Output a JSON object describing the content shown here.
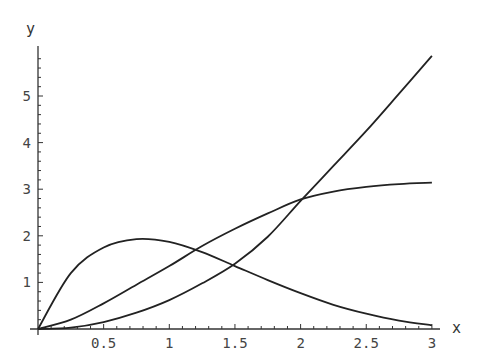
{
  "chart_data": {
    "type": "line",
    "title": "",
    "xlabel": "x",
    "ylabel": "y",
    "xlim": [
      0,
      3
    ],
    "ylim": [
      0,
      5.9
    ],
    "grid": false,
    "legend": null,
    "x_ticks": [
      0.5,
      1,
      1.5,
      2,
      2.5,
      3
    ],
    "x_tick_labels": [
      "0.5",
      "1",
      "1.5",
      "2",
      "2.5",
      "3"
    ],
    "y_ticks": [
      1,
      2,
      3,
      4,
      5
    ],
    "y_tick_labels": [
      "1",
      "2",
      "3",
      "4",
      "5"
    ],
    "x": [
      0,
      0.25,
      0.5,
      0.75,
      1.0,
      1.25,
      1.5,
      1.75,
      2.0,
      2.25,
      2.5,
      2.75,
      3.0
    ],
    "series": [
      {
        "name": "hump",
        "values": [
          0,
          1.2,
          1.75,
          1.93,
          1.87,
          1.65,
          1.35,
          1.05,
          0.77,
          0.52,
          0.33,
          0.18,
          0.08
        ]
      },
      {
        "name": "saturating",
        "values": [
          0,
          0.2,
          0.55,
          0.95,
          1.35,
          1.78,
          2.15,
          2.48,
          2.78,
          2.95,
          3.05,
          3.11,
          3.14
        ]
      },
      {
        "name": "steep",
        "values": [
          0,
          0.03,
          0.15,
          0.35,
          0.62,
          0.98,
          1.4,
          1.98,
          2.75,
          3.5,
          4.25,
          5.05,
          5.86
        ]
      }
    ]
  },
  "colors": {
    "line": "#222222",
    "axis": "#333333"
  }
}
